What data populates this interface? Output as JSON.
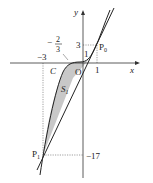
{
  "diagram": {
    "axes": {
      "x_label": "x",
      "y_label": "y",
      "origin_label": "O"
    },
    "ticks": {
      "x_neg3": "−3",
      "x_1": "1",
      "y_3": "3",
      "y_1": "1",
      "y_neg17": "−17",
      "frac_minus": "−",
      "frac_num": "2",
      "frac_den": "3"
    },
    "points": {
      "P0": "P",
      "P0_sub": "0",
      "P1": "P",
      "P1_sub": "1"
    },
    "curve_label": "C",
    "region_label": "S",
    "region_sub": "1",
    "colors": {
      "shade": "#c8c8c8",
      "line": "#222222",
      "guide": "#666666"
    }
  }
}
